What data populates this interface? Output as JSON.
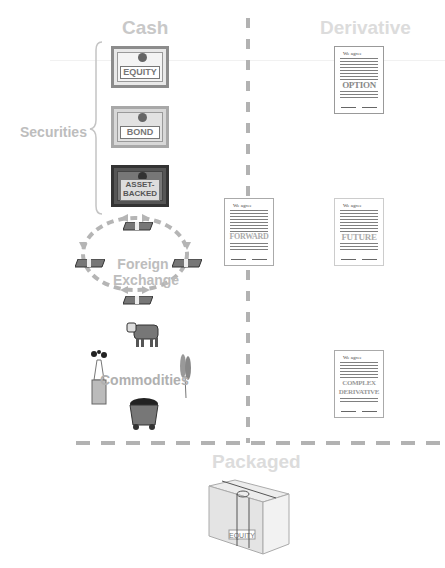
{
  "sections": {
    "cash": "Cash",
    "derivative": "Derivative",
    "packaged": "Packaged"
  },
  "labels": {
    "securities": "Securities",
    "foreign_exchange_1": "Foreign",
    "foreign_exchange_2": "Exchange",
    "commodities": "Commodities"
  },
  "securities": [
    {
      "name": "equity",
      "label": "EQUITY"
    },
    {
      "name": "bond",
      "label": "BOND"
    },
    {
      "name": "asset-backed",
      "label": "ASSET-BACKED",
      "line1": "ASSET-",
      "line2": "BACKED"
    }
  ],
  "derivatives": [
    {
      "name": "option",
      "header": "We agree",
      "word": "OPTION"
    },
    {
      "name": "forward",
      "header": "We agree",
      "word": "FORWARD"
    },
    {
      "name": "future",
      "header": "We agree",
      "word": "FUTURE"
    },
    {
      "name": "complex-derivative",
      "header": "We agree",
      "word1": "COMPLEX",
      "word2": "DERIVATIVE"
    }
  ],
  "packaged_box": {
    "label": "EQUITY"
  },
  "colors": {
    "title": "#c8c8c8",
    "dash": "#b2b2b2",
    "ink": "#555555"
  }
}
